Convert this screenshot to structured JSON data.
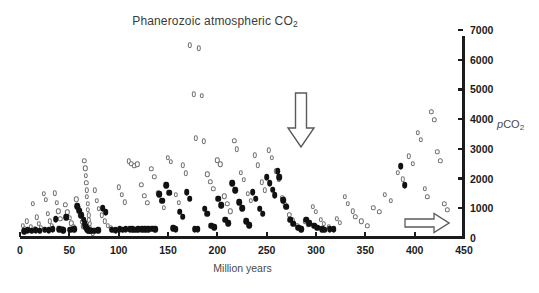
{
  "chart_data": {
    "type": "scatter",
    "title": "Phanerozoic atmospheric CO2",
    "title_main": "Phanerozoic atmospheric CO",
    "title_sub": "2",
    "xlabel": "Million years",
    "ylabel": "pCO2",
    "ylabel_main": "CO",
    "ylabel_prefix": "p",
    "ylabel_sub": "2",
    "xlim": [
      0,
      450
    ],
    "ylim": [
      0,
      7000
    ],
    "xticks": [
      0,
      50,
      100,
      150,
      200,
      250,
      300,
      350,
      400,
      450
    ],
    "yticks": [
      0,
      1000,
      2000,
      3000,
      4000,
      5000,
      6000,
      7000
    ],
    "y_axis_position": "right",
    "grid": false,
    "legend": null,
    "series": [
      {
        "name": "proxy-open-circles",
        "marker": "open-circle",
        "color": "#6f6f6f",
        "points": [
          [
            3,
            420
          ],
          [
            5,
            310
          ],
          [
            7,
            560
          ],
          [
            9,
            250
          ],
          [
            11,
            380
          ],
          [
            13,
            1150
          ],
          [
            15,
            300
          ],
          [
            17,
            700
          ],
          [
            19,
            480
          ],
          [
            21,
            330
          ],
          [
            24,
            1480
          ],
          [
            26,
            1280
          ],
          [
            28,
            820
          ],
          [
            30,
            560
          ],
          [
            32,
            400
          ],
          [
            35,
            1500
          ],
          [
            37,
            1180
          ],
          [
            39,
            900
          ],
          [
            41,
            640
          ],
          [
            43,
            300
          ],
          [
            46,
            1120
          ],
          [
            48,
            870
          ],
          [
            50,
            690
          ],
          [
            52,
            500
          ],
          [
            54,
            360
          ],
          [
            57,
            1300
          ],
          [
            59,
            1000
          ],
          [
            61,
            760
          ],
          [
            63,
            540
          ],
          [
            64,
            390
          ],
          [
            65,
            2600
          ],
          [
            66,
            2350
          ],
          [
            66.5,
            2100
          ],
          [
            67,
            1850
          ],
          [
            67.5,
            1600
          ],
          [
            68,
            1380
          ],
          [
            68.5,
            1150
          ],
          [
            69,
            950
          ],
          [
            69.5,
            760
          ],
          [
            70,
            600
          ],
          [
            70.5,
            470
          ],
          [
            71,
            350
          ],
          [
            72,
            270
          ],
          [
            73,
            200
          ],
          [
            74,
            160
          ],
          [
            76,
            1600
          ],
          [
            78,
            1250
          ],
          [
            80,
            980
          ],
          [
            83,
            760
          ],
          [
            86,
            560
          ],
          [
            89,
            420
          ],
          [
            92,
            330
          ],
          [
            95,
            260
          ],
          [
            100,
            1700
          ],
          [
            103,
            1450
          ],
          [
            106,
            1200
          ],
          [
            110,
            2580
          ],
          [
            113,
            2500
          ],
          [
            116,
            2430
          ],
          [
            119,
            2480
          ],
          [
            123,
            1800
          ],
          [
            126,
            1420
          ],
          [
            129,
            1180
          ],
          [
            133,
            2330
          ],
          [
            136,
            2060
          ],
          [
            140,
            1500
          ],
          [
            143,
            1250
          ],
          [
            146,
            1020
          ],
          [
            150,
            2700
          ],
          [
            153,
            2560
          ],
          [
            158,
            1450
          ],
          [
            161,
            1180
          ],
          [
            165,
            2450
          ],
          [
            168,
            2180
          ],
          [
            172,
            6480
          ],
          [
            181,
            6380
          ],
          [
            176,
            4840
          ],
          [
            184,
            4780
          ],
          [
            178,
            3350
          ],
          [
            186,
            3250
          ],
          [
            190,
            2150
          ],
          [
            193,
            1900
          ],
          [
            196,
            1650
          ],
          [
            200,
            2620
          ],
          [
            203,
            2480
          ],
          [
            207,
            1400
          ],
          [
            210,
            1150
          ],
          [
            213,
            900
          ],
          [
            217,
            3280
          ],
          [
            220,
            2980
          ],
          [
            224,
            2200
          ],
          [
            227,
            1950
          ],
          [
            231,
            1480
          ],
          [
            234,
            1250
          ],
          [
            238,
            2780
          ],
          [
            241,
            2450
          ],
          [
            245,
            1880
          ],
          [
            248,
            1600
          ],
          [
            252,
            2950
          ],
          [
            255,
            2700
          ],
          [
            259,
            2250
          ],
          [
            262,
            1980
          ],
          [
            266,
            1350
          ],
          [
            269,
            1100
          ],
          [
            273,
            780
          ],
          [
            276,
            600
          ],
          [
            281,
            420
          ],
          [
            284,
            340
          ],
          [
            289,
            560
          ],
          [
            292,
            460
          ],
          [
            297,
            1050
          ],
          [
            300,
            880
          ],
          [
            305,
            620
          ],
          [
            308,
            480
          ],
          [
            313,
            380
          ],
          [
            316,
            300
          ],
          [
            321,
            650
          ],
          [
            324,
            520
          ],
          [
            329,
            1380
          ],
          [
            332,
            1150
          ],
          [
            337,
            900
          ],
          [
            340,
            720
          ],
          [
            346,
            560
          ],
          [
            352,
            420
          ],
          [
            358,
            1020
          ],
          [
            364,
            880
          ],
          [
            370,
            1450
          ],
          [
            376,
            1250
          ],
          [
            383,
            2200
          ],
          [
            388,
            1980
          ],
          [
            394,
            2750
          ],
          [
            398,
            2500
          ],
          [
            403,
            3550
          ],
          [
            406,
            3300
          ],
          [
            410,
            1650
          ],
          [
            413,
            1380
          ],
          [
            417,
            4250
          ],
          [
            420,
            3980
          ],
          [
            423,
            2900
          ],
          [
            426,
            2600
          ],
          [
            430,
            1150
          ],
          [
            433,
            950
          ]
        ]
      },
      {
        "name": "proxy-filled-diamonds",
        "marker": "filled-diamond",
        "color": "#111111",
        "points": [
          [
            4,
            230
          ],
          [
            8,
            260
          ],
          [
            12,
            240
          ],
          [
            16,
            270
          ],
          [
            20,
            250
          ],
          [
            25,
            280
          ],
          [
            29,
            260
          ],
          [
            33,
            300
          ],
          [
            36,
            640
          ],
          [
            40,
            290
          ],
          [
            44,
            260
          ],
          [
            47,
            700
          ],
          [
            51,
            280
          ],
          [
            55,
            300
          ],
          [
            58,
            1080
          ],
          [
            60,
            920
          ],
          [
            62,
            760
          ],
          [
            64.5,
            620
          ],
          [
            65.5,
            500
          ],
          [
            66.2,
            420
          ],
          [
            67.2,
            350
          ],
          [
            68.2,
            300
          ],
          [
            69.2,
            270
          ],
          [
            70.2,
            250
          ],
          [
            72,
            240
          ],
          [
            75,
            250
          ],
          [
            79,
            260
          ],
          [
            84,
            1000
          ],
          [
            87,
            870
          ],
          [
            93,
            280
          ],
          [
            97,
            260
          ],
          [
            101,
            300
          ],
          [
            104,
            280
          ],
          [
            107,
            290
          ],
          [
            111,
            300
          ],
          [
            114,
            290
          ],
          [
            117,
            280
          ],
          [
            120,
            300
          ],
          [
            124,
            290
          ],
          [
            127,
            300
          ],
          [
            130,
            290
          ],
          [
            134,
            310
          ],
          [
            137,
            300
          ],
          [
            141,
            1480
          ],
          [
            144,
            1250
          ],
          [
            148,
            1780
          ],
          [
            151,
            1520
          ],
          [
            155,
            320
          ],
          [
            158,
            300
          ],
          [
            162,
            880
          ],
          [
            165,
            720
          ],
          [
            169,
            1550
          ],
          [
            172,
            1320
          ],
          [
            177,
            300
          ],
          [
            180,
            290
          ],
          [
            187,
            980
          ],
          [
            190,
            820
          ],
          [
            194,
            420
          ],
          [
            197,
            360
          ],
          [
            201,
            1320
          ],
          [
            204,
            1100
          ],
          [
            208,
            620
          ],
          [
            211,
            500
          ],
          [
            215,
            1850
          ],
          [
            218,
            1600
          ],
          [
            222,
            1200
          ],
          [
            225,
            1000
          ],
          [
            229,
            560
          ],
          [
            232,
            440
          ],
          [
            236,
            1550
          ],
          [
            239,
            1320
          ],
          [
            243,
            980
          ],
          [
            246,
            820
          ],
          [
            250,
            2050
          ],
          [
            253,
            1850
          ],
          [
            256,
            1620
          ],
          [
            258,
            1450
          ],
          [
            261,
            2250
          ],
          [
            263,
            2050
          ],
          [
            267,
            1280
          ],
          [
            270,
            1050
          ],
          [
            274,
            620
          ],
          [
            277,
            480
          ],
          [
            282,
            350
          ],
          [
            285,
            300
          ],
          [
            290,
            620
          ],
          [
            293,
            500
          ],
          [
            298,
            420
          ],
          [
            301,
            350
          ],
          [
            306,
            300
          ],
          [
            309,
            280
          ],
          [
            314,
            290
          ],
          [
            318,
            300
          ],
          [
            386,
            2420
          ],
          [
            390,
            1780
          ]
        ]
      }
    ],
    "annotations": [
      {
        "name": "down-arrow",
        "shape": "arrow-down",
        "x": 265,
        "y_top": 4900,
        "y_bottom": 3100,
        "style": "hollow-outline"
      },
      {
        "name": "right-arrow",
        "shape": "arrow-right",
        "x_start": 398,
        "x_end": 438,
        "y": 790,
        "style": "hollow-outline"
      }
    ]
  },
  "figure": {
    "background_color": "#ffffff",
    "axis_color": "#1b1b1b",
    "marker_open_color": "#6f6f6f",
    "marker_filled_color": "#111111",
    "title_color": "#3b3b3b"
  }
}
